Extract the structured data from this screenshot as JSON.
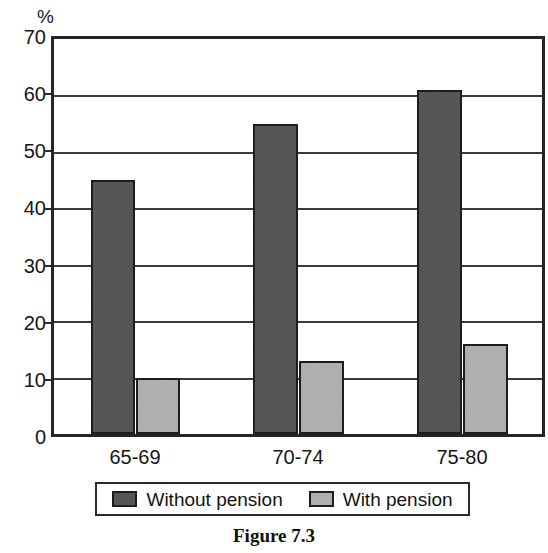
{
  "chart_data": {
    "type": "bar",
    "title": "",
    "caption": "Figure 7.3",
    "xlabel": "",
    "ylabel": "%",
    "unit_label": "%",
    "categories": [
      "65-69",
      "70-74",
      "75-80"
    ],
    "series": [
      {
        "name": "Without pension",
        "color": "#4e4e4e",
        "values": [
          45,
          55,
          61
        ]
      },
      {
        "name": "With pension",
        "color": "#a9a9a9",
        "values": [
          10,
          13,
          16
        ]
      }
    ],
    "ylim": [
      0,
      70
    ],
    "ytick_labels": [
      "70",
      "60",
      "50",
      "40",
      "30",
      "20",
      "10",
      "0"
    ],
    "ytick_values": [
      70,
      60,
      50,
      40,
      30,
      20,
      10,
      0
    ],
    "ytick_step": 10,
    "grid": true,
    "grid_axis": "y",
    "legend_position": "bottom-center",
    "legend_entries": [
      "Without pension",
      "With pension"
    ],
    "bar_border_color": "#1d1d1d",
    "frame_color": "#252525"
  },
  "axes": {
    "y_labels": [
      "70",
      "60",
      "50",
      "40",
      "30",
      "20",
      "10",
      "0"
    ],
    "x_labels": [
      "65-69",
      "70-74",
      "75-80"
    ],
    "unit": "%"
  },
  "legend": {
    "entries": [
      {
        "label": "Without pension",
        "swatch": "dark-swatch-icon"
      },
      {
        "label": "With pension",
        "swatch": "light-swatch-icon"
      }
    ]
  },
  "caption": {
    "text": "Figure 7.3"
  }
}
